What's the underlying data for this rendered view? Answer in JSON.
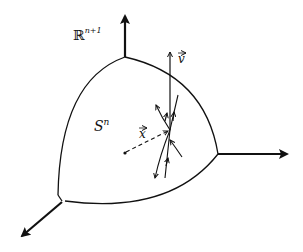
{
  "diagram": {
    "ambient_space_label": "ℝ",
    "ambient_space_superscript": "n+1",
    "sphere_label": "S",
    "sphere_superscript": "n",
    "position_vector_label": "x",
    "velocity_vector_label": "v",
    "line_color": "#111111",
    "axes": [
      "up",
      "right",
      "down-left"
    ]
  }
}
